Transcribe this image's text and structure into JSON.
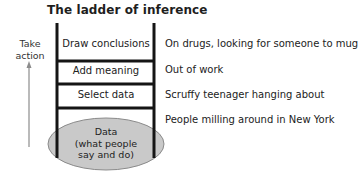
{
  "title": "The ladder of inference",
  "side_label": {
    "line1": "Take",
    "line2": "action"
  },
  "rungs": [
    {
      "label": "Draw conclusions",
      "example": "On drugs, looking for someone to mug"
    },
    {
      "label": "Add meaning",
      "example": "Out of work"
    },
    {
      "label": "Select data",
      "example": "Scruffy teenager hanging about"
    }
  ],
  "base": {
    "line1": "Data",
    "line2": "(what people",
    "line3": "say and do)",
    "example": "People milling around in New York"
  },
  "colors": {
    "ladder": "#151515",
    "ellipse_fill": "#c9c9c9",
    "ellipse_stroke": "#8a8a8a",
    "arrow": "#8c8c8c"
  }
}
